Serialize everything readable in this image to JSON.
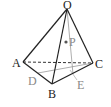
{
  "diagram": {
    "type": "tetrahedron",
    "vertices": {
      "O": {
        "label": "O",
        "x": 67,
        "y": 9
      },
      "A": {
        "label": "A",
        "x": 23,
        "y": 62
      },
      "B": {
        "label": "B",
        "x": 52,
        "y": 84
      },
      "C": {
        "label": "C",
        "x": 93,
        "y": 63
      }
    },
    "points": {
      "P": {
        "label": "P",
        "x": 66,
        "y": 42
      },
      "D": {
        "label": "D",
        "x": 38,
        "y": 73
      },
      "E": {
        "label": "E",
        "x": 73,
        "y": 74
      }
    },
    "edges_solid": [
      "OA",
      "OB",
      "OC",
      "AB",
      "BC"
    ],
    "edges_dashed": [
      "AC"
    ],
    "aux_lines": [
      "DC",
      "OE"
    ],
    "colors": {
      "edge": "#222222",
      "aux": "#999999"
    }
  }
}
